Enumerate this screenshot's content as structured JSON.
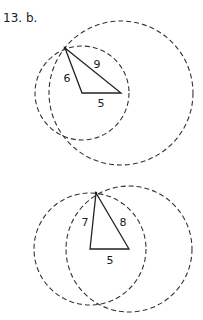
{
  "problem": {
    "label": "13. b."
  },
  "figures": [
    {
      "name": "construction-1",
      "triangle": {
        "apex": [
          65,
          48
        ],
        "base_left": [
          82,
          93
        ],
        "base_right": [
          121,
          93
        ]
      },
      "sides": {
        "left": "6",
        "right": "9",
        "base": "5"
      },
      "circles": [
        {
          "center": [
            82,
            93
          ],
          "r": 47
        },
        {
          "center": [
            121,
            93
          ],
          "r": 72
        }
      ]
    },
    {
      "name": "construction-2",
      "triangle": {
        "apex": [
          96,
          193
        ],
        "base_left": [
          90,
          249
        ],
        "base_right": [
          129,
          249
        ]
      },
      "sides": {
        "left": "7",
        "right": "8",
        "base": "5"
      },
      "circles": [
        {
          "center": [
            90,
            249
          ],
          "r": 56
        },
        {
          "center": [
            129,
            249
          ],
          "r": 64
        }
      ]
    }
  ]
}
